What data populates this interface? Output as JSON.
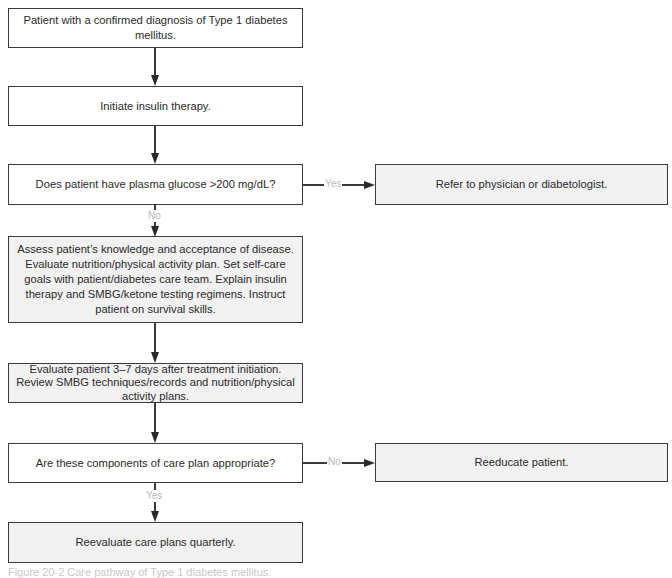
{
  "flowchart": {
    "nodes": {
      "start": "Patient with a confirmed diagnosis of Type 1 diabetes mellitus.",
      "initiate": "Initiate insulin therapy.",
      "decision_glucose": "Does patient have plasma glucose >200 mg/dL?",
      "refer": "Refer to physician or diabetologist.",
      "assess": "Assess patient’s knowledge and acceptance of disease. Evaluate nutrition/physical activity plan. Set self-care goals with patient/diabetes care team. Explain insulin therapy and SMBG/ketone testing regimens. Instruct patient on survival skills.",
      "evaluate": "Evaluate patient 3–7 days after treatment initiation. Review SMBG techniques/records and nutrition/physical activity plans.",
      "decision_care_plan": "Are these components of care plan appropriate?",
      "reeducate": "Reeducate patient.",
      "reevaluate": "Reevaluate care plans quarterly."
    },
    "edge_labels": {
      "glucose_yes": "Yes",
      "glucose_no": "No",
      "care_plan_no": "No",
      "care_plan_yes": "Yes"
    },
    "colors": {
      "border": "#3a3a3a",
      "shaded_fill": "#f1f1f1",
      "edge_label": "#b8b8b8"
    }
  },
  "caption": "Figure 20-2 Care pathway of Type 1 diabetes mellitus."
}
